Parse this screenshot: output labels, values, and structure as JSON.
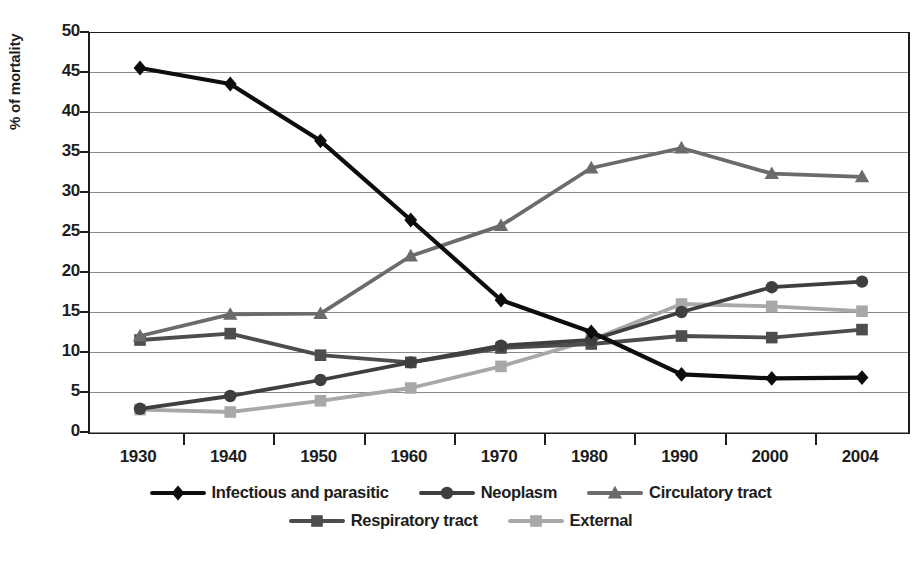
{
  "chart_data": {
    "type": "line",
    "title": "",
    "xlabel": "",
    "ylabel": "% of mortality",
    "categories": [
      "1930",
      "1940",
      "1950",
      "1960",
      "1970",
      "1980",
      "1990",
      "2000",
      "2004"
    ],
    "ylim": [
      0,
      50
    ],
    "yticks": [
      0,
      5,
      10,
      15,
      20,
      25,
      30,
      35,
      40,
      45,
      50
    ],
    "ytick_labels": [
      "0",
      "5",
      "10",
      "15",
      "20",
      "25",
      "30",
      "35",
      "40",
      "45",
      "50"
    ],
    "grid": true,
    "legend_position": "bottom",
    "series": [
      {
        "name": "Infectious and parasitic",
        "marker": "diamond",
        "color": "#0d0d0d",
        "values": [
          45.5,
          43.5,
          36.4,
          26.5,
          16.5,
          12.5,
          7.2,
          6.7,
          6.8
        ]
      },
      {
        "name": "Neoplasm",
        "marker": "circle",
        "color": "#3f3f3f",
        "values": [
          2.9,
          4.5,
          6.5,
          8.7,
          10.8,
          11.5,
          15.0,
          18.1,
          18.8
        ]
      },
      {
        "name": "Circulatory tract",
        "marker": "triangle",
        "color": "#6b6b6b",
        "values": [
          12.0,
          14.7,
          14.8,
          22.0,
          25.8,
          33.0,
          35.5,
          32.3,
          31.9
        ]
      },
      {
        "name": "Respiratory tract",
        "marker": "square",
        "color": "#4d4d4d",
        "values": [
          11.5,
          12.3,
          9.6,
          8.7,
          10.5,
          11.0,
          12.0,
          11.8,
          12.8
        ]
      },
      {
        "name": "External",
        "marker": "square",
        "color": "#a8a8a8",
        "values": [
          2.8,
          2.5,
          3.9,
          5.5,
          8.2,
          11.5,
          16.0,
          15.7,
          15.1
        ]
      }
    ]
  },
  "legend": {
    "rows": [
      [
        {
          "label": "Infectious and parasitic"
        },
        {
          "label": "Neoplasm"
        },
        {
          "label": "Circulatory tract"
        }
      ],
      [
        {
          "label": "Respiratory tract"
        },
        {
          "label": "External"
        }
      ]
    ]
  }
}
